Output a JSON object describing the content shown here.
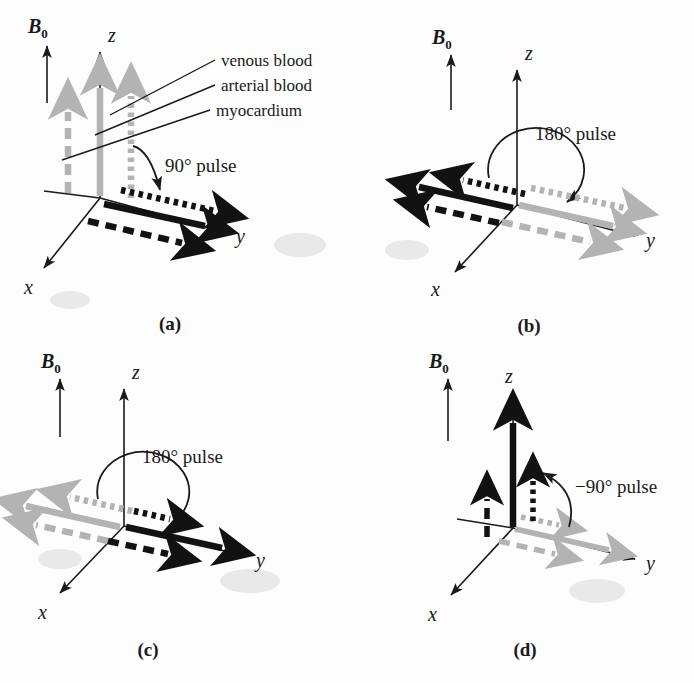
{
  "figure": {
    "background_color": "#fdfdfd",
    "black_color": "#121212",
    "gray_color": "#b3b3b3"
  },
  "tissue_legend": {
    "items": [
      {
        "label": "venous blood",
        "line_style": "dashed",
        "key": "venous"
      },
      {
        "label": "arterial blood",
        "line_style": "dotted",
        "key": "arterial"
      },
      {
        "label": "myocardium",
        "line_style": "solid",
        "key": "myocardium"
      }
    ]
  },
  "axes": {
    "x_label": "x",
    "y_label": "y",
    "z_label": "z",
    "b0_label": "B",
    "b0_subscript": "0"
  },
  "panels": [
    {
      "id": "a",
      "caption": "(a)",
      "pulse_label": "90° pulse",
      "pulse_angle_deg": 90,
      "description": "Equilibrium magnetization along +z tipped into the transverse plane toward +y",
      "vectors": [
        {
          "tissue": "venous blood",
          "style": "dashed",
          "color": "gray",
          "direction": "+z",
          "length": 0.62
        },
        {
          "tissue": "myocardium",
          "style": "solid",
          "color": "gray",
          "direction": "+z",
          "length": 0.78
        },
        {
          "tissue": "arterial blood",
          "style": "dotted",
          "color": "gray",
          "direction": "+z",
          "length": 0.72
        },
        {
          "tissue": "arterial blood",
          "style": "dotted",
          "color": "black",
          "direction": "+y",
          "length": 0.95
        },
        {
          "tissue": "myocardium",
          "style": "solid",
          "color": "black",
          "direction": "+y",
          "length": 0.92
        },
        {
          "tissue": "venous blood",
          "style": "dashed",
          "color": "black",
          "direction": "+y",
          "length": 0.88
        }
      ]
    },
    {
      "id": "b",
      "caption": "(b)",
      "pulse_label": "180° pulse",
      "pulse_angle_deg": 180,
      "description": "Transverse magnetization inverted from +y to −y by a 180° pulse",
      "vectors": [
        {
          "tissue": "arterial blood",
          "style": "dotted",
          "color": "gray",
          "direction": "+y",
          "length": 0.95
        },
        {
          "tissue": "myocardium",
          "style": "solid",
          "color": "gray",
          "direction": "+y",
          "length": 0.92
        },
        {
          "tissue": "venous blood",
          "style": "dashed",
          "color": "gray",
          "direction": "+y",
          "length": 0.88
        },
        {
          "tissue": "arterial blood",
          "style": "dotted",
          "color": "black",
          "direction": "-y",
          "length": 0.72
        },
        {
          "tissue": "myocardium",
          "style": "solid",
          "color": "black",
          "direction": "-y",
          "length": 0.92
        },
        {
          "tissue": "venous blood",
          "style": "dashed",
          "color": "black",
          "direction": "-y",
          "length": 0.8
        }
      ]
    },
    {
      "id": "c",
      "caption": "(c)",
      "pulse_label": "180° pulse",
      "pulse_angle_deg": 180,
      "description": "Second 180° pulse returns transverse magnetization from −y to +y",
      "vectors": [
        {
          "tissue": "arterial blood",
          "style": "dotted",
          "color": "gray",
          "direction": "-y",
          "length": 0.72
        },
        {
          "tissue": "myocardium",
          "style": "solid",
          "color": "gray",
          "direction": "-y",
          "length": 0.92
        },
        {
          "tissue": "venous blood",
          "style": "dashed",
          "color": "gray",
          "direction": "-y",
          "length": 0.8
        },
        {
          "tissue": "arterial blood",
          "style": "dotted",
          "color": "black",
          "direction": "+y",
          "length": 0.42
        },
        {
          "tissue": "myocardium",
          "style": "solid",
          "color": "black",
          "direction": "+y",
          "length": 0.92
        },
        {
          "tissue": "venous blood",
          "style": "dashed",
          "color": "black",
          "direction": "+y",
          "length": 0.62
        }
      ]
    },
    {
      "id": "d",
      "caption": "(d)",
      "pulse_label": "−90° pulse",
      "pulse_angle_deg": -90,
      "description": "Transverse magnetization returned to the +z axis with differing recovered magnitudes",
      "vectors": [
        {
          "tissue": "arterial blood",
          "style": "dotted",
          "color": "gray",
          "direction": "+y",
          "length": 0.42
        },
        {
          "tissue": "myocardium",
          "style": "solid",
          "color": "gray",
          "direction": "+y",
          "length": 0.92
        },
        {
          "tissue": "venous blood",
          "style": "dashed",
          "color": "gray",
          "direction": "+y",
          "length": 0.62
        },
        {
          "tissue": "myocardium",
          "style": "solid",
          "color": "black",
          "direction": "+z",
          "length": 0.92
        },
        {
          "tissue": "arterial blood",
          "style": "dotted",
          "color": "black",
          "direction": "+z",
          "length": 0.4
        },
        {
          "tissue": "venous blood",
          "style": "dashed",
          "color": "black",
          "direction": "+z",
          "length": 0.3
        }
      ]
    }
  ]
}
